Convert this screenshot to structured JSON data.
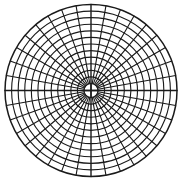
{
  "diagram": {
    "type": "polar-grid",
    "center": {
      "x": 91,
      "y": 90.5
    },
    "outer_radius": 86,
    "inner_radius": 7,
    "ring_count": 12,
    "spoke_count": 36,
    "spoke_step_degrees": 10,
    "stroke_color": "#1a1a1a",
    "background_color": "#ffffff"
  }
}
